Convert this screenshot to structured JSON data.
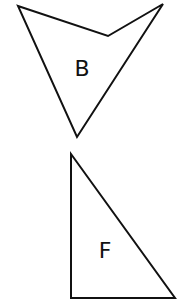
{
  "diagram": {
    "shapes": [
      {
        "id": "B",
        "label": "B",
        "kind": "concave-quadrilateral",
        "points": "18,6 108,36 163,4 77,137",
        "label_pos": [
          82,
          75
        ]
      },
      {
        "id": "F",
        "label": "F",
        "kind": "right-triangle",
        "points": "71,154 71,298 175,298",
        "label_pos": [
          105,
          258
        ]
      }
    ],
    "stroke_color": "#111111",
    "background": "#ffffff"
  }
}
